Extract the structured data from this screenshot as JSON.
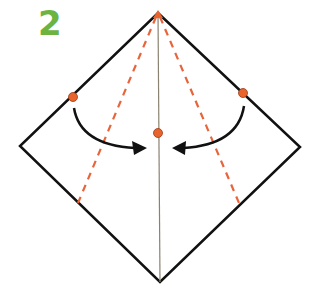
{
  "step_number": "2",
  "colors": {
    "step_number": "#6cb33f",
    "outline": "#111111",
    "valley_fold": "#e8643a",
    "center_crease": "#8a8270",
    "reference_dot": "#e8642c",
    "arrow": "#111111"
  },
  "diagram": {
    "shape": "square rotated 45 degrees (diamond)",
    "vertices": {
      "top": [
        158,
        13
      ],
      "left": [
        20,
        146
      ],
      "right": [
        300,
        147
      ],
      "bottom": [
        160,
        282
      ]
    },
    "center_crease": {
      "from": [
        158,
        13
      ],
      "to": [
        160,
        282
      ]
    },
    "valley_folds": [
      {
        "from": [
          157,
          15
        ],
        "to": [
          78,
          203
        ]
      },
      {
        "from": [
          159,
          15
        ],
        "to": [
          239,
          203
        ]
      }
    ],
    "dots": [
      [
        73,
        97
      ],
      [
        243,
        93
      ],
      [
        158,
        133
      ]
    ],
    "arrows": [
      "left edge folds to center crease",
      "right edge folds to center crease"
    ]
  }
}
